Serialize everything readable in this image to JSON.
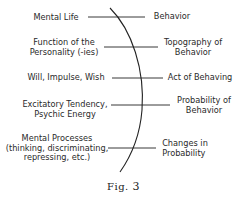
{
  "figure": {
    "caption": "Fig.",
    "number": "3",
    "left_terms": [
      {
        "lines": [
          "Mental Life"
        ]
      },
      {
        "lines": [
          "Function of the",
          "Personality (-ies)"
        ]
      },
      {
        "lines": [
          "Will, Impulse, Wish"
        ]
      },
      {
        "lines": [
          "Excitatory Tendency,",
          "Psychic Energy"
        ]
      },
      {
        "lines": [
          "Mental Processes",
          "(thinking, discriminating,",
          "repressing, etc.)"
        ]
      }
    ],
    "right_terms": [
      {
        "lines": [
          "Behavior"
        ]
      },
      {
        "lines": [
          "Topography of",
          "Behavior"
        ]
      },
      {
        "lines": [
          "Act of Behaving"
        ]
      },
      {
        "lines": [
          "Probability of",
          "Behavior"
        ]
      },
      {
        "lines": [
          "Changes in",
          "Probability"
        ]
      }
    ]
  }
}
